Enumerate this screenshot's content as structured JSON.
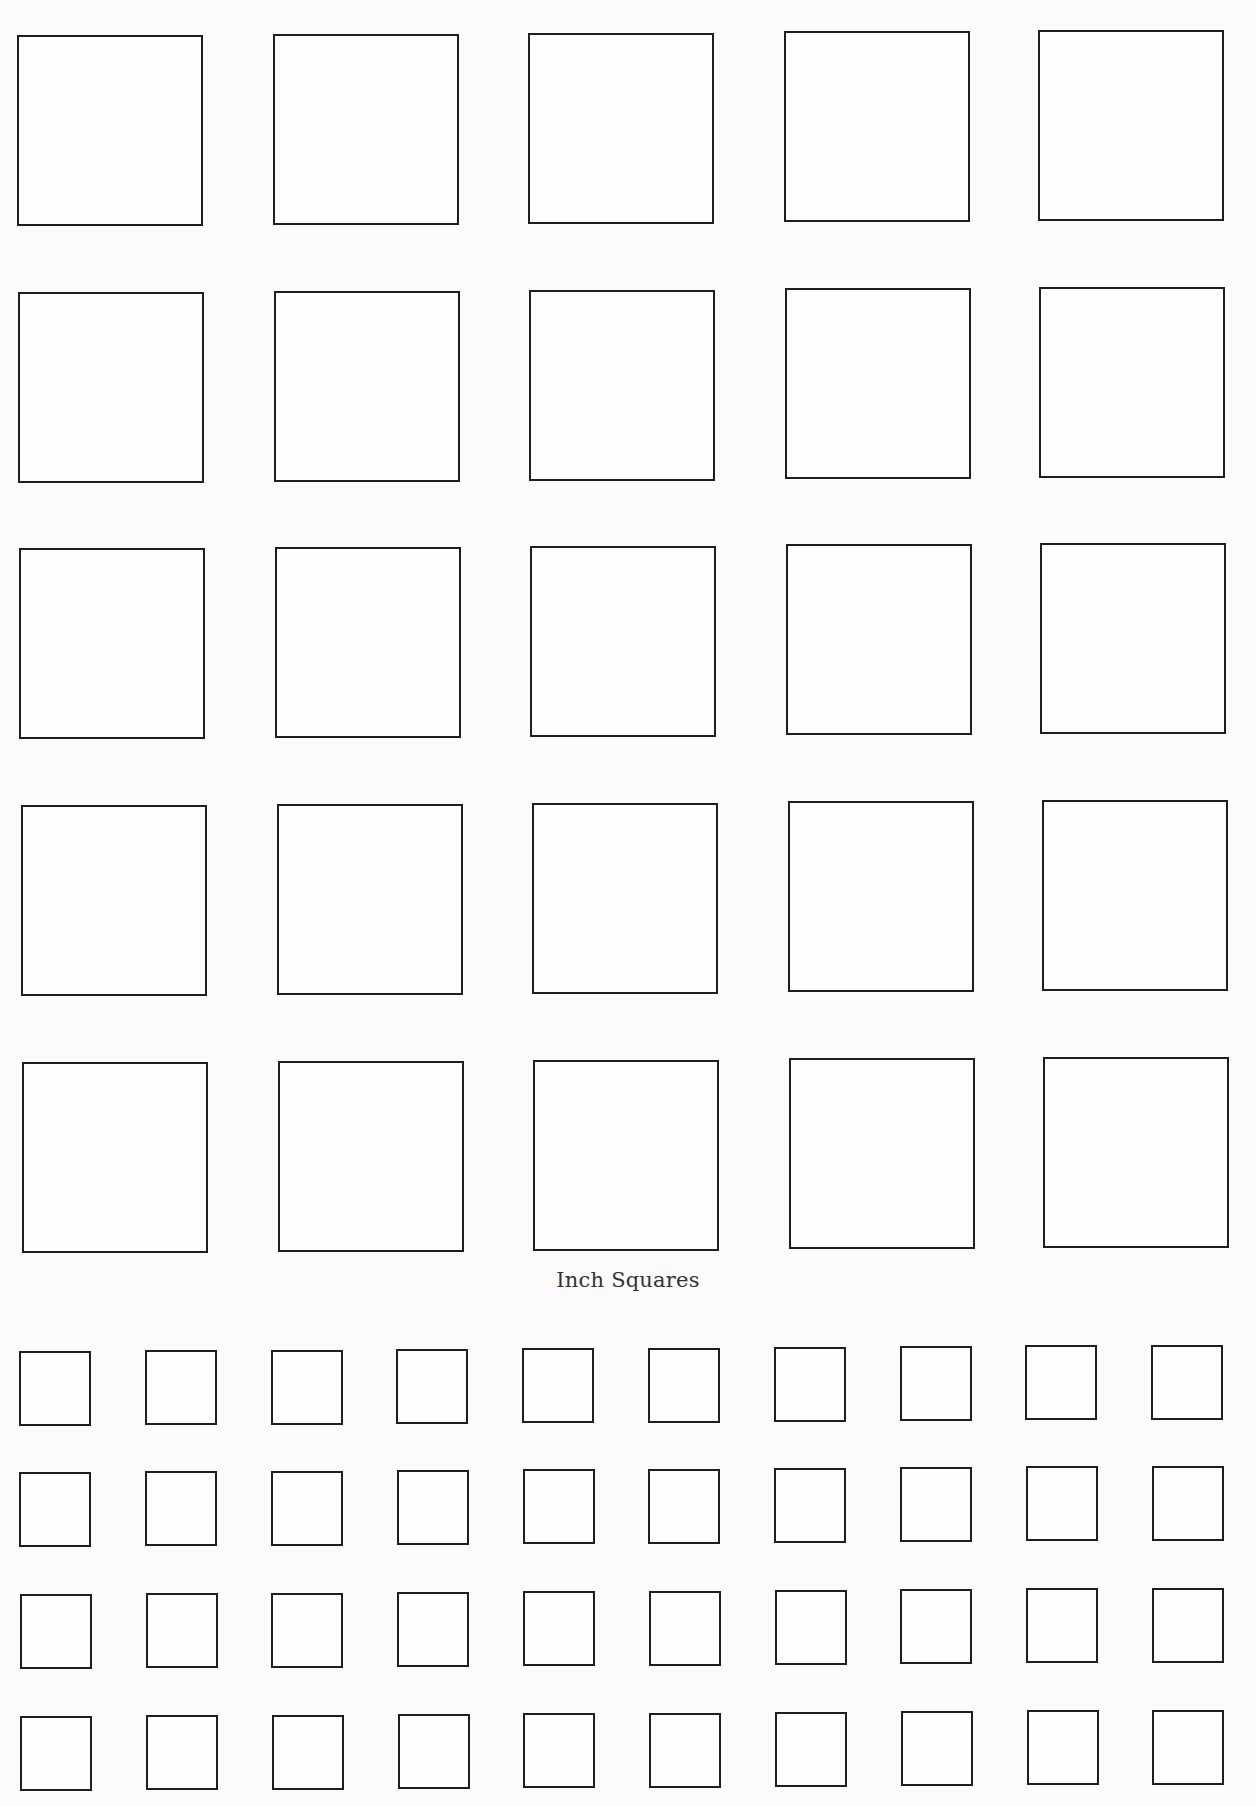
{
  "label": "Inch Squares",
  "large_grid": {
    "rows": 5,
    "cols": 5,
    "col_x": [
      17,
      273,
      528,
      784,
      1038
    ],
    "row_y": [
      35,
      292,
      548,
      805,
      1062
    ],
    "width": 186,
    "height": 191,
    "drift_x_per_row": 1.2,
    "drift_y_per_col": -1.2
  },
  "small_grid": {
    "rows": 4,
    "cols": 10,
    "start_x": 19,
    "col_step": 125.8,
    "row_y": [
      1351,
      1472,
      1594,
      1716
    ],
    "width": 72,
    "height": 75,
    "drift_y_per_col": -0.7,
    "drift_x_per_row": 0.4
  }
}
